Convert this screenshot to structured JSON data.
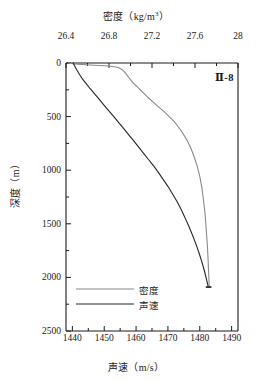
{
  "chart_data": {
    "type": "line",
    "title": "密度（kg/m3）",
    "title_main": "密度",
    "title_unit": "（kg/m",
    "title_unit_sup": "3",
    "title_unit_close": "）",
    "xlabel_bottom": "声速（m/s）",
    "xlabel_bottom_main": "声速",
    "xlabel_bottom_unit": "（m/s）",
    "ylabel": "深度（m）",
    "ylabel_main": "深度",
    "ylabel_unit": "（m）",
    "annotation": "Ⅱ-8",
    "grid": false,
    "legend_position": "bottom-left-inside",
    "axes": {
      "top": {
        "name": "density",
        "unit": "kg/m3",
        "range": [
          26.4,
          28.0
        ],
        "major_ticks": [
          "26.4",
          "26.8",
          "27.2",
          "27.6",
          "28"
        ],
        "major_tick_values": [
          26.4,
          26.8,
          27.2,
          27.6,
          28.0
        ],
        "minor_tick_values": [
          26.6,
          27.0,
          27.4,
          27.8
        ]
      },
      "bottom": {
        "name": "sound_speed",
        "unit": "m/s",
        "range": [
          1438,
          1492
        ],
        "major_ticks": [
          "1440",
          "1450",
          "1460",
          "1470",
          "1480",
          "1490"
        ],
        "major_tick_values": [
          1440,
          1450,
          1460,
          1470,
          1480,
          1490
        ],
        "minor_tick_values": [
          1445,
          1455,
          1465,
          1475,
          1485
        ]
      },
      "left": {
        "name": "depth",
        "unit": "m",
        "range": [
          0,
          2500
        ],
        "inverted": true,
        "major_ticks": [
          "0",
          "500",
          "1000",
          "1500",
          "2000",
          "2500"
        ],
        "major_tick_values": [
          0,
          500,
          1000,
          1500,
          2000,
          2500
        ],
        "minor_tick_values": [
          250,
          750,
          1250,
          1750,
          2250
        ]
      }
    },
    "series": [
      {
        "name": "密度",
        "legend_label": "密度",
        "color": "#8a8a8a",
        "x_axis": "top",
        "x_unit": "kg/m3",
        "points": [
          [
            26.42,
            0
          ],
          [
            26.48,
            8
          ],
          [
            26.62,
            18
          ],
          [
            26.8,
            28
          ],
          [
            26.88,
            40
          ],
          [
            26.92,
            60
          ],
          [
            26.95,
            90
          ],
          [
            26.98,
            130
          ],
          [
            27.02,
            180
          ],
          [
            27.08,
            240
          ],
          [
            27.15,
            310
          ],
          [
            27.24,
            390
          ],
          [
            27.33,
            470
          ],
          [
            27.41,
            550
          ],
          [
            27.47,
            630
          ],
          [
            27.52,
            710
          ],
          [
            27.56,
            790
          ],
          [
            27.59,
            870
          ],
          [
            27.62,
            960
          ],
          [
            27.645,
            1060
          ],
          [
            27.665,
            1170
          ],
          [
            27.68,
            1290
          ],
          [
            27.695,
            1420
          ],
          [
            27.705,
            1560
          ],
          [
            27.715,
            1700
          ],
          [
            27.722,
            1840
          ],
          [
            27.728,
            1980
          ],
          [
            27.732,
            2090
          ]
        ]
      },
      {
        "name": "声速",
        "legend_label": "声速",
        "color": "#262626",
        "x_axis": "bottom",
        "x_unit": "m/s",
        "points": [
          [
            1440.2,
            0
          ],
          [
            1440.6,
            20
          ],
          [
            1441.0,
            45
          ],
          [
            1441.6,
            75
          ],
          [
            1442.3,
            110
          ],
          [
            1443.2,
            150
          ],
          [
            1444.4,
            195
          ],
          [
            1445.6,
            240
          ],
          [
            1446.9,
            285
          ],
          [
            1448.2,
            330
          ],
          [
            1449.4,
            375
          ],
          [
            1450.7,
            420
          ],
          [
            1452.0,
            465
          ],
          [
            1453.4,
            515
          ],
          [
            1454.8,
            565
          ],
          [
            1456.2,
            615
          ],
          [
            1457.7,
            670
          ],
          [
            1459.2,
            725
          ],
          [
            1460.7,
            780
          ],
          [
            1462.3,
            840
          ],
          [
            1463.9,
            900
          ],
          [
            1465.5,
            960
          ],
          [
            1467.1,
            1025
          ],
          [
            1468.6,
            1090
          ],
          [
            1470.1,
            1155
          ],
          [
            1471.5,
            1225
          ],
          [
            1472.9,
            1295
          ],
          [
            1474.2,
            1370
          ],
          [
            1475.4,
            1445
          ],
          [
            1476.6,
            1525
          ],
          [
            1477.7,
            1605
          ],
          [
            1478.8,
            1690
          ],
          [
            1479.8,
            1775
          ],
          [
            1480.7,
            1860
          ],
          [
            1481.5,
            1945
          ],
          [
            1482.2,
            2030
          ],
          [
            1482.7,
            2090
          ]
        ]
      }
    ],
    "end_markers": [
      {
        "series": "密度",
        "depth": 2090,
        "value": 27.732
      },
      {
        "series": "声速",
        "depth": 2090,
        "value": 1482.7
      }
    ]
  },
  "legend": {
    "entries": [
      {
        "label": "密度",
        "color": "#8a8a8a"
      },
      {
        "label": "声速",
        "color": "#262626"
      }
    ]
  }
}
